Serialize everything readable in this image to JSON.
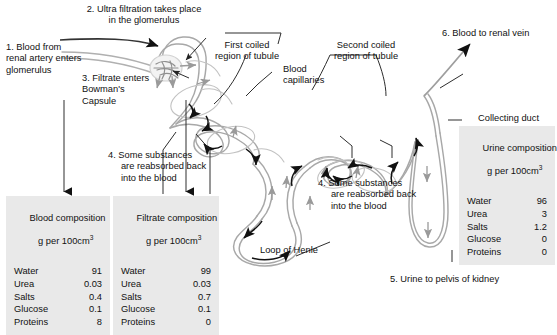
{
  "diagram": {
    "title_semantic": "nephron-structure-and-filtration",
    "colors": {
      "tubule_stroke": "#a8a8a8",
      "capillary_stroke": "#b9b9b9",
      "arrow_dark": "#111111",
      "arrow_gray": "#9a9a9a",
      "leader_line": "#222222",
      "table_background": "#e9e9e9",
      "text": "#111111",
      "page_background": "#ffffff"
    }
  },
  "annotations": {
    "step1": "1. Blood from\nrenal artery enters\nglomerulus",
    "step2": "2. Ultra filtration takes place\nin the glomerulus",
    "step3": "3. Filtrate enters\nBowman's\nCapsule",
    "step4_left": "4. Some substances\n     are reabsorbed back\n     into the blood",
    "step4_right": "4. Some substances\n     are reabsorbed back\n     into the blood",
    "step5": "5. Urine to pelvis of kidney",
    "step6": "6. Blood to renal vein",
    "first_coiled": "First coiled\nregion of tubule",
    "second_coiled": "Second coiled\nregion of tubule",
    "blood_capillaries": "Blood\ncapillaries",
    "loop_of_henle": "Loop of Henle",
    "collecting_duct": "Collecting duct"
  },
  "tables": {
    "blood": {
      "title_line1": "Blood composition",
      "title_line2_pre": "g per 100cm",
      "title_line2_sup": "3",
      "rows": [
        {
          "label": "Water",
          "value": "91"
        },
        {
          "label": "Urea",
          "value": "0.03"
        },
        {
          "label": "Salts",
          "value": "0.4"
        },
        {
          "label": "Glucose",
          "value": "0.1"
        },
        {
          "label": "Proteins",
          "value": "8"
        }
      ]
    },
    "filtrate": {
      "title_line1": "Filtrate composition",
      "title_line2_pre": "g per 100cm",
      "title_line2_sup": "3",
      "rows": [
        {
          "label": "Water",
          "value": "99"
        },
        {
          "label": "Urea",
          "value": "0.03"
        },
        {
          "label": "Salts",
          "value": "0.7"
        },
        {
          "label": "Glucose",
          "value": "0.1"
        },
        {
          "label": "Proteins",
          "value": "0"
        }
      ]
    },
    "urine": {
      "title_line1": "Urine composition",
      "title_line2_pre": "g per 100cm",
      "title_line2_sup": "3",
      "rows": [
        {
          "label": "Water",
          "value": "96"
        },
        {
          "label": "Urea",
          "value": "3"
        },
        {
          "label": "Salts",
          "value": "1.2"
        },
        {
          "label": "Glucose",
          "value": "0"
        },
        {
          "label": "Proteins",
          "value": "0"
        }
      ]
    }
  }
}
